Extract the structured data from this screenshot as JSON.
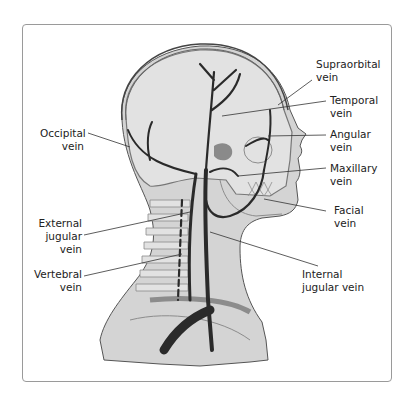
{
  "figure": {
    "labels": {
      "supraorbital": [
        "Supraorbital",
        "vein"
      ],
      "temporal": [
        "Temporal",
        "vein"
      ],
      "angular": [
        "Angular",
        "vein"
      ],
      "maxillary": [
        "Maxillary",
        "vein"
      ],
      "facial": [
        "Facial",
        "vein"
      ],
      "internal_jugular": [
        "Internal",
        "jugular vein"
      ],
      "occipital": [
        "Occipital",
        "vein"
      ],
      "external_jugular": [
        "External",
        "jugular",
        "vein"
      ],
      "vertebral": [
        "Vertebral",
        "vein"
      ]
    },
    "colors": {
      "body_fill": "#d4d4d4",
      "skull_fill": "#e2e2e2",
      "vein": "#2a2a2a",
      "bone_outline": "#8c8c8c",
      "frame_border": "#9a9a9a",
      "gland": "#8a8a8a"
    }
  }
}
